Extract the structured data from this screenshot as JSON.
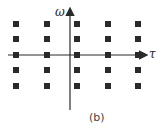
{
  "diagram": {
    "axes": {
      "vertical_label": "ω",
      "horizontal_label": "τ"
    },
    "caption": "(b)",
    "grid": {
      "columns_x": [
        16,
        47,
        77,
        108,
        138
      ],
      "rows_y": [
        24,
        39,
        55,
        70,
        86
      ],
      "marker": "filled-square",
      "color": "#2a2a2a"
    }
  }
}
